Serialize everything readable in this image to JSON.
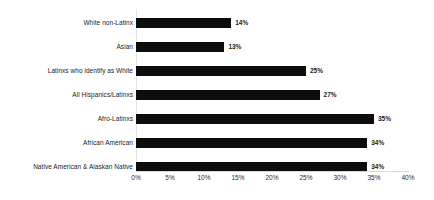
{
  "chart_data": {
    "type": "bar",
    "orientation": "horizontal",
    "title": "",
    "subtitle": "",
    "xlabel": "",
    "ylabel": "",
    "xlim": [
      0,
      40
    ],
    "xtick_labels": [
      "0%",
      "5%",
      "10%",
      "15%",
      "20%",
      "25%",
      "30%",
      "35%",
      "40%"
    ],
    "xtick_values": [
      0,
      5,
      10,
      15,
      20,
      25,
      30,
      35,
      40
    ],
    "grid": false,
    "legend": false,
    "value_suffix": "%",
    "bar_color": "#0d0d0d",
    "categories": [
      "White non-Latinx",
      "Asian",
      "Latinxs who identify as White",
      "All Hispanics/Latinxs",
      "Afro-Latinxs",
      "African American",
      "Native American & Alaskan Native"
    ],
    "values": [
      14,
      13,
      25,
      27,
      35,
      34,
      34
    ],
    "data_labels": [
      "14%",
      "13%",
      "25%",
      "27%",
      "35%",
      "34%",
      "34%"
    ]
  }
}
